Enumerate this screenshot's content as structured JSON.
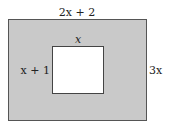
{
  "diagram": {
    "outer_rectangle": {
      "width_label": "2x + 2",
      "height_label": "3x",
      "fill": "#c9c9c9",
      "stroke": "#555555"
    },
    "inner_rectangle": {
      "width_label": "x",
      "height_label": "x + 1",
      "fill": "#ffffff",
      "stroke": "#444444"
    }
  }
}
